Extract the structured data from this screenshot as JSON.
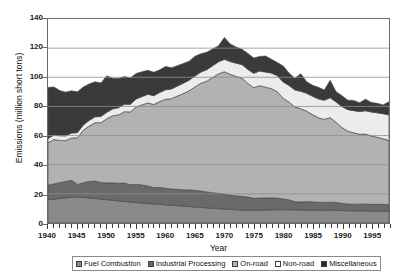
{
  "chart_data": {
    "type": "area",
    "stacked": true,
    "title": "",
    "xlabel": "Year",
    "ylabel": "Emissions (million short tons)",
    "xlim": [
      1940,
      1998
    ],
    "ylim": [
      0,
      140
    ],
    "ytick_values": [
      0,
      20,
      40,
      60,
      80,
      100,
      120,
      140
    ],
    "ytick_labels": [
      "0",
      "20",
      "40",
      "60",
      "80",
      "100",
      "120",
      "140"
    ],
    "xtick_labels": [
      "1940",
      "1945",
      "1950",
      "1955",
      "1960",
      "1965",
      "1970",
      "1975",
      "1980",
      "1985",
      "1990",
      "1995"
    ],
    "xtick_values": [
      1940,
      1945,
      1950,
      1955,
      1960,
      1965,
      1970,
      1975,
      1980,
      1985,
      1990,
      1995
    ],
    "x_minor_tick_step": 1,
    "grid": "horizontal",
    "legend_position": "bottom",
    "x": [
      1940,
      1941,
      1942,
      1943,
      1944,
      1945,
      1946,
      1947,
      1948,
      1949,
      1950,
      1951,
      1952,
      1953,
      1954,
      1955,
      1956,
      1957,
      1958,
      1959,
      1960,
      1961,
      1962,
      1963,
      1964,
      1965,
      1966,
      1967,
      1968,
      1969,
      1970,
      1971,
      1972,
      1973,
      1974,
      1975,
      1976,
      1977,
      1978,
      1979,
      1980,
      1981,
      1982,
      1983,
      1984,
      1985,
      1986,
      1987,
      1988,
      1989,
      1990,
      1991,
      1992,
      1993,
      1994,
      1995,
      1996,
      1997,
      1998
    ],
    "series": [
      {
        "name": "Fuel Combustion",
        "color": "#8a8a8a",
        "values": [
          16.0,
          16.4,
          16.8,
          17.2,
          17.6,
          18.0,
          17.6,
          17.2,
          16.8,
          16.4,
          16.0,
          15.6,
          15.2,
          14.8,
          14.4,
          14.0,
          13.7,
          13.4,
          13.1,
          12.8,
          12.5,
          12.2,
          11.9,
          11.6,
          11.3,
          11.0,
          10.7,
          10.4,
          10.1,
          9.8,
          9.5,
          9.3,
          9.1,
          8.9,
          8.8,
          8.7,
          8.8,
          8.9,
          9.0,
          9.1,
          9.2,
          9.1,
          9.0,
          8.9,
          8.9,
          8.8,
          8.7,
          8.7,
          8.8,
          8.8,
          8.6,
          8.4,
          8.3,
          8.3,
          8.3,
          8.2,
          8.2,
          8.2,
          8.1
        ]
      },
      {
        "name": "Industrial Processing",
        "color": "#6a6a6a",
        "values": [
          10.0,
          10.4,
          10.9,
          11.3,
          11.7,
          8.5,
          10.0,
          11.3,
          12.0,
          11.4,
          11.5,
          12.0,
          12.0,
          12.6,
          11.8,
          12.6,
          12.4,
          12.0,
          11.2,
          11.5,
          11.4,
          11.1,
          11.2,
          11.2,
          11.4,
          11.4,
          11.2,
          10.9,
          10.7,
          10.5,
          10.3,
          9.7,
          9.5,
          9.4,
          9.0,
          8.2,
          8.4,
          8.3,
          8.2,
          8.0,
          7.3,
          6.8,
          5.6,
          5.5,
          5.8,
          5.6,
          5.5,
          5.4,
          5.5,
          5.3,
          4.9,
          4.6,
          4.6,
          4.6,
          4.7,
          4.6,
          4.6,
          4.6,
          4.5
        ]
      },
      {
        "name": "On-road",
        "color": "#b2b2b2",
        "values": [
          29.0,
          30.5,
          29.0,
          28.0,
          29.0,
          32.0,
          36.0,
          38.0,
          40.0,
          41.0,
          44.0,
          46.0,
          47.0,
          49.0,
          50.0,
          53.0,
          55.0,
          57.0,
          57.0,
          59.0,
          61.0,
          62.0,
          64.0,
          66.0,
          68.0,
          71.0,
          74.0,
          76.0,
          79.0,
          82.0,
          84.0,
          83.0,
          82.0,
          81.0,
          78.0,
          76.0,
          77.0,
          76.0,
          75.0,
          73.0,
          69.0,
          67.0,
          65.0,
          64.0,
          62.0,
          60.0,
          58.0,
          57.0,
          58.0,
          55.0,
          52.0,
          50.0,
          49.0,
          48.0,
          48.0,
          47.0,
          46.0,
          45.0,
          44.0
        ]
      },
      {
        "name": "Non-road",
        "color": "#ececec",
        "values": [
          3.0,
          3.1,
          3.2,
          3.3,
          3.4,
          3.5,
          3.7,
          3.9,
          4.1,
          4.3,
          4.5,
          4.7,
          4.9,
          5.1,
          5.3,
          5.5,
          5.7,
          5.9,
          6.1,
          6.3,
          6.5,
          6.7,
          6.9,
          7.1,
          7.3,
          7.5,
          7.7,
          7.9,
          8.1,
          8.3,
          8.5,
          8.8,
          9.1,
          9.4,
          9.6,
          9.8,
          10.1,
          10.4,
          10.7,
          11.0,
          11.3,
          11.5,
          11.7,
          12.0,
          12.3,
          12.6,
          12.9,
          13.2,
          13.6,
          14.0,
          14.4,
          14.8,
          15.2,
          15.6,
          16.0,
          16.4,
          16.8,
          17.2,
          17.6
        ]
      },
      {
        "name": "Miscellaneous",
        "color": "#3a3a3a",
        "values": [
          35.0,
          33.0,
          31.0,
          30.0,
          29.0,
          28.0,
          26.0,
          25.0,
          24.0,
          23.0,
          25.0,
          21.0,
          20.0,
          19.0,
          18.0,
          17.5,
          17.0,
          16.5,
          16.0,
          15.5,
          16.0,
          14.5,
          14.0,
          13.5,
          13.0,
          13.5,
          12.5,
          12.0,
          11.5,
          11.0,
          15.0,
          12.0,
          11.0,
          10.5,
          11.0,
          10.5,
          10.0,
          11.0,
          9.5,
          9.0,
          11.0,
          8.5,
          8.0,
          12.0,
          8.0,
          7.5,
          8.0,
          7.0,
          12.0,
          7.0,
          7.5,
          6.5,
          7.0,
          6.0,
          8.0,
          6.5,
          6.5,
          6.0,
          9.0
        ]
      }
    ]
  },
  "axes": {
    "y_title": "Emissions (million short tons)",
    "x_title": "Year"
  },
  "legend": {
    "items": [
      {
        "label": "Fuel Combustion",
        "swatch": "#8a8a8a"
      },
      {
        "label": "Industrial Processing",
        "swatch": "#6a6a6a"
      },
      {
        "label": "On-road",
        "swatch": "#b2b2b2"
      },
      {
        "label": "Non-road",
        "swatch": "#ffffff"
      },
      {
        "label": "Miscellaneous",
        "swatch": "#2b2b2b"
      }
    ]
  }
}
